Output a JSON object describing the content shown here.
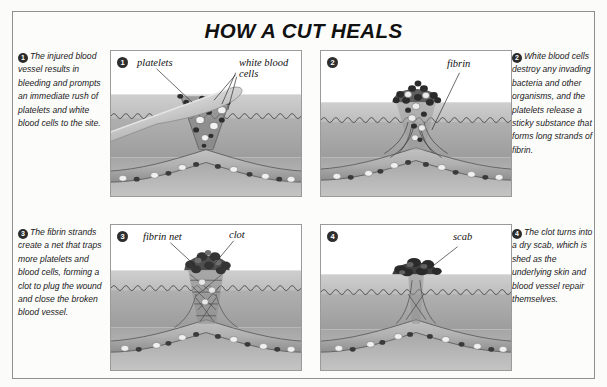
{
  "figure": {
    "title": "HOW A CUT HEALS"
  },
  "captions": [
    {
      "number": "1",
      "text": "The injured blood vessel results in bleeding and prompts an immediate rush of platelets and white blood cells to the site."
    },
    {
      "number": "2",
      "text": "White blood cells destroy any invading bacteria and other organisms, and the platelets release a sticky substance that forms long strands of fibrin."
    },
    {
      "number": "3",
      "text": "The fibrin strands create a net that traps more platelets and blood cells, forming a clot to plug the wound and close the broken blood vessel."
    },
    {
      "number": "4",
      "text": "The clot turns into a dry scab, which is shed as the underlying skin and blood vessel repair themselves."
    }
  ],
  "panels": [
    {
      "number": "1",
      "labels": [
        {
          "text": "platelets"
        },
        {
          "text": "white blood"
        },
        {
          "text": "cells"
        }
      ]
    },
    {
      "number": "2",
      "labels": [
        {
          "text": "fibrin"
        }
      ]
    },
    {
      "number": "3",
      "labels": [
        {
          "text": "fibrin net"
        },
        {
          "text": "clot"
        }
      ]
    },
    {
      "number": "4",
      "labels": [
        {
          "text": "scab"
        }
      ]
    }
  ],
  "colors": {
    "frame_border": "#8f8f8f",
    "panel_border": "#9a9a9a",
    "page_background": "#fbfbfa",
    "epidermis": "#c8c8c8",
    "dermis": "#a8a8a8",
    "subcutaneous": "#9a9a9a",
    "vessel": "#b4b4b4",
    "clot_dark": "#5a5a5a",
    "blade": "#d8d8d8",
    "badge": "#2b2b2b",
    "text": "#1a1a1a"
  }
}
